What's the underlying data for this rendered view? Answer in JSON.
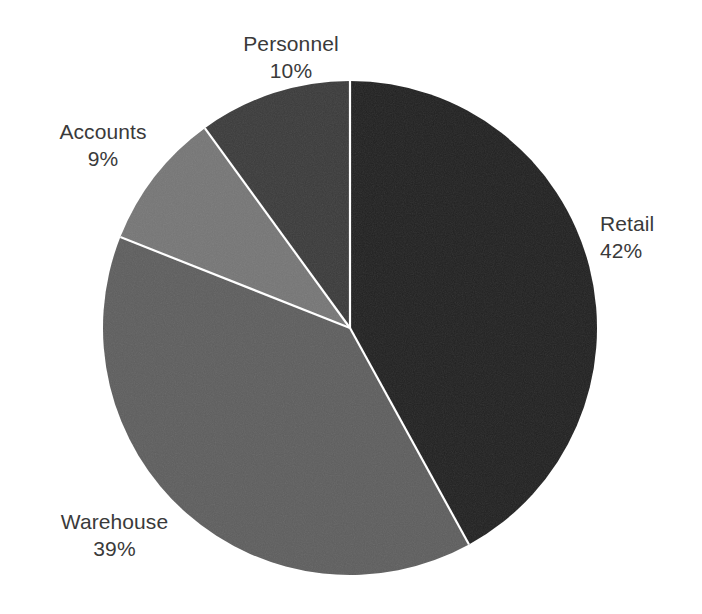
{
  "chart_data": {
    "type": "pie",
    "title": "",
    "subtitle": "",
    "xlabel": "",
    "ylabel": "",
    "legend_position": "none",
    "grid": false,
    "label_format": "name + percentage, two lines, outside slice",
    "start_angle_deg": 0,
    "direction": "clockwise",
    "categories": [
      "Retail",
      "Warehouse",
      "Accounts",
      "Personnel"
    ],
    "values": [
      42,
      39,
      9,
      10
    ],
    "units": "%",
    "total": 100,
    "slices": [
      {
        "name": "Retail",
        "value": 42,
        "value_label": "42%",
        "color": "#212121",
        "start_angle_deg": 0,
        "end_angle_deg": 151.2,
        "label_side": "right"
      },
      {
        "name": "Warehouse",
        "value": 39,
        "value_label": "39%",
        "color": "#5e5e5e",
        "start_angle_deg": 151.2,
        "end_angle_deg": 291.6,
        "label_side": "bottom-left"
      },
      {
        "name": "Accounts",
        "value": 9,
        "value_label": "9%",
        "color": "#767676",
        "start_angle_deg": 291.6,
        "end_angle_deg": 324.0,
        "label_side": "left"
      },
      {
        "name": "Personnel",
        "value": 10,
        "value_label": "10%",
        "color": "#3b3b3b",
        "start_angle_deg": 324.0,
        "end_angle_deg": 360.0,
        "label_side": "top"
      }
    ]
  },
  "geometry": {
    "center_x": 350,
    "center_y": 328,
    "radius": 247,
    "separator_color": "#ffffff",
    "separator_width": 2.2,
    "background": "#ffffff"
  },
  "labels": {
    "personnel": {
      "name": "Personnel",
      "value": "10%"
    },
    "accounts": {
      "name": "Accounts",
      "value": "9%"
    },
    "retail": {
      "name": "Retail",
      "value": "42%"
    },
    "warehouse": {
      "name": "Warehouse",
      "value": "39%"
    }
  }
}
